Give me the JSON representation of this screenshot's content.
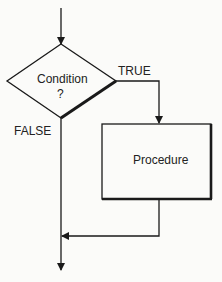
{
  "diagram": {
    "type": "flowchart",
    "decision": {
      "label_line1": "Condition",
      "label_line2": "?"
    },
    "true_label": "TRUE",
    "false_label": "FALSE",
    "process": {
      "label": "Procedure"
    },
    "colors": {
      "stroke": "#1a1a1a",
      "background": "#fbfbf9",
      "text": "#222222"
    }
  }
}
